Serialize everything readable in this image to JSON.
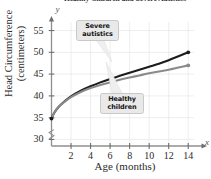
{
  "chart_data": {
    "type": "line",
    "title": "Healthy Children and Severe Autistics",
    "xlabel": "Age (months)",
    "ylabel_line1": "Head Circumference",
    "ylabel_line2": "(centimeters)",
    "xlim": [
      0,
      15
    ],
    "ylim": [
      28.5,
      56.5
    ],
    "xticks": [
      2,
      4,
      6,
      8,
      10,
      12,
      14
    ],
    "yticks": [
      30,
      35,
      40,
      45,
      50,
      55
    ],
    "grid": true,
    "axis_break_y": true,
    "legend_position": "inline-callouts",
    "x_axis_letter": "x",
    "y_axis_letter": "y",
    "series": [
      {
        "name": "Severe autistics",
        "color": "#1c1c1c",
        "label": "Severe autistics",
        "x": [
          0,
          0.3,
          0.7,
          1.2,
          2,
          3,
          4,
          5,
          6,
          7,
          8,
          9,
          10,
          11,
          12,
          13,
          14
        ],
        "values": [
          34.8,
          36.2,
          37.4,
          38.5,
          39.9,
          41.2,
          42.2,
          43.1,
          43.9,
          44.6,
          45.3,
          46.0,
          46.7,
          47.4,
          48.2,
          49.1,
          50.0
        ]
      },
      {
        "name": "Healthy children",
        "color": "#8a8a8a",
        "label": "Healthy children",
        "x": [
          0,
          0.3,
          0.7,
          1.2,
          2,
          3,
          4,
          5,
          6,
          7,
          8,
          9,
          10,
          11,
          12,
          13,
          14
        ],
        "values": [
          34.8,
          36.2,
          37.4,
          38.4,
          39.7,
          40.9,
          41.8,
          42.5,
          43.1,
          43.7,
          44.2,
          44.7,
          45.2,
          45.6,
          46.0,
          46.5,
          47.0
        ]
      }
    ],
    "endpoint_markers": [
      {
        "series": "Severe autistics",
        "x": 14,
        "y": 50.0
      },
      {
        "series": "Healthy children",
        "x": 14,
        "y": 47.0
      }
    ]
  },
  "callouts": {
    "severe": {
      "line1": "Severe",
      "line2": "autistics"
    },
    "healthy": {
      "line1": "Healthy",
      "line2": "children"
    }
  },
  "ytick_labels": [
    "55",
    "50",
    "45",
    "40",
    "35",
    "30"
  ],
  "xtick_labels": [
    "2",
    "4",
    "6",
    "8",
    "10",
    "12",
    "14"
  ]
}
